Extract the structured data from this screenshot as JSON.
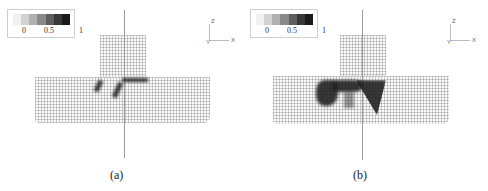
{
  "figure": {
    "panels": [
      {
        "id": "a",
        "caption": "(a)",
        "legend": {
          "ticks": [
            "0",
            "0.5",
            "1"
          ],
          "swatches": [
            "#f0f0f0",
            "#d2d2d2",
            "#b0b0b0",
            "#8a8a8a",
            "#5e5e5e",
            "#383838",
            "#1a1a1a"
          ]
        },
        "axes": {
          "vertical": "Z",
          "horizontal": "X",
          "origin": "Y"
        },
        "description": "Deformed finite element mesh of T-shaped specimen with localized damage bands near the junction"
      },
      {
        "id": "b",
        "caption": "(b)",
        "legend": {
          "ticks": [
            "0",
            "0.5",
            "1"
          ],
          "swatches": [
            "#f0f0f0",
            "#d2d2d2",
            "#b0b0b0",
            "#8a8a8a",
            "#5e5e5e",
            "#383838",
            "#1a1a1a"
          ]
        },
        "axes": {
          "vertical": "Z",
          "horizontal": "X",
          "origin": "Y"
        },
        "description": "Deformed finite element mesh of T-shaped specimen with extensive damage region below the junction"
      }
    ]
  }
}
